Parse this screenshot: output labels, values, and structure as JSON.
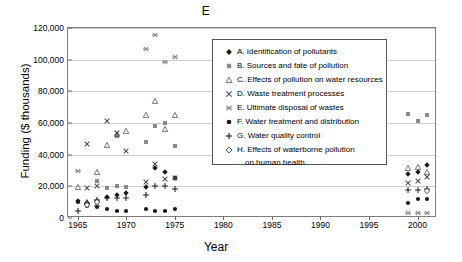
{
  "chart_data": {
    "type": "scatter",
    "title": "E",
    "xlabel": "Year",
    "ylabel": "Funding ($ thousands)",
    "xlim": [
      1964,
      2002
    ],
    "ylim": [
      0,
      120000
    ],
    "xticks": [
      1965,
      1970,
      1975,
      1980,
      1985,
      1990,
      1995,
      2000
    ],
    "yticks": [
      0,
      20000,
      40000,
      60000,
      80000,
      100000,
      120000
    ],
    "ytick_labels": [
      "0",
      "20,000",
      "40,000",
      "60,000",
      "80,000",
      "100,000",
      "120,000"
    ],
    "xtick_labels": [
      "1965",
      "1970",
      "1975",
      "1980",
      "1985",
      "1990",
      "1995",
      "2000"
    ],
    "grid": "horizontal",
    "legend_position": "upper-right-inside",
    "series": [
      {
        "key": "A",
        "name": "A. Identification of pollutants",
        "marker": "filled-diamond",
        "color": "#1a1a1a",
        "points": [
          {
            "x": 1965,
            "y": 10500
          },
          {
            "x": 1966,
            "y": 8800
          },
          {
            "x": 1967,
            "y": 11000
          },
          {
            "x": 1968,
            "y": 13200
          },
          {
            "x": 1969,
            "y": 14600
          },
          {
            "x": 1970,
            "y": 16000
          },
          {
            "x": 1972,
            "y": 19800
          },
          {
            "x": 1973,
            "y": 31500
          },
          {
            "x": 1974,
            "y": 28800
          },
          {
            "x": 1975,
            "y": 25000
          },
          {
            "x": 1999,
            "y": 27500
          },
          {
            "x": 2000,
            "y": 29300
          },
          {
            "x": 2001,
            "y": 33200
          }
        ]
      },
      {
        "key": "B",
        "name": "B. Sources and fate of pollution",
        "marker": "filled-square",
        "color": "#8a8a8a",
        "points": [
          {
            "x": 1966,
            "y": 9200
          },
          {
            "x": 1967,
            "y": 23500
          },
          {
            "x": 1968,
            "y": 19200
          },
          {
            "x": 1969,
            "y": 20000
          },
          {
            "x": 1970,
            "y": 19300
          },
          {
            "x": 1972,
            "y": 47800
          },
          {
            "x": 1973,
            "y": 58200
          },
          {
            "x": 1974,
            "y": 60200
          },
          {
            "x": 1975,
            "y": 45300
          },
          {
            "x": 1969,
            "y": 52000
          },
          {
            "x": 1999,
            "y": 65800
          },
          {
            "x": 2000,
            "y": 61500
          },
          {
            "x": 2001,
            "y": 65300
          }
        ]
      },
      {
        "key": "C",
        "name": "C. Effects of pollution on water resources",
        "marker": "open-triangle",
        "color": "#4d4d4d",
        "points": [
          {
            "x": 1965,
            "y": 19800
          },
          {
            "x": 1966,
            "y": 9800
          },
          {
            "x": 1967,
            "y": 28800
          },
          {
            "x": 1967,
            "y": 9000
          },
          {
            "x": 1968,
            "y": 46000
          },
          {
            "x": 1969,
            "y": 52800
          },
          {
            "x": 1970,
            "y": 55000
          },
          {
            "x": 1972,
            "y": 64800
          },
          {
            "x": 1973,
            "y": 73800
          },
          {
            "x": 1974,
            "y": 56000
          },
          {
            "x": 1975,
            "y": 64800
          },
          {
            "x": 1999,
            "y": 31800
          },
          {
            "x": 2000,
            "y": 32500
          },
          {
            "x": 2001,
            "y": 29000
          }
        ]
      },
      {
        "key": "D",
        "name": "D. Waste treatment processes",
        "marker": "x-cross",
        "color": "#4d4d4d",
        "points": [
          {
            "x": 1966,
            "y": 18800
          },
          {
            "x": 1966,
            "y": 46500
          },
          {
            "x": 1967,
            "y": 20000
          },
          {
            "x": 1968,
            "y": 61500
          },
          {
            "x": 1969,
            "y": 53500
          },
          {
            "x": 1970,
            "y": 42500
          },
          {
            "x": 1972,
            "y": 22800
          },
          {
            "x": 1973,
            "y": 33800
          },
          {
            "x": 1974,
            "y": 24800
          },
          {
            "x": 1975,
            "y": 25000
          },
          {
            "x": 1999,
            "y": 22000
          },
          {
            "x": 2000,
            "y": 23500
          },
          {
            "x": 2001,
            "y": 26000
          }
        ]
      },
      {
        "key": "E",
        "name": "E. Ultimate disposal of wastes",
        "marker": "star-cross",
        "color": "#8a8a8a",
        "points": [
          {
            "x": 1965,
            "y": 29500
          },
          {
            "x": 1972,
            "y": 107000
          },
          {
            "x": 1973,
            "y": 115500
          },
          {
            "x": 1974,
            "y": 98800
          },
          {
            "x": 1975,
            "y": 101800
          },
          {
            "x": 1999,
            "y": 3200
          },
          {
            "x": 2000,
            "y": 3200
          },
          {
            "x": 2001,
            "y": 3200
          }
        ]
      },
      {
        "key": "F",
        "name": "F. Water treatment and distribution",
        "marker": "filled-circle",
        "color": "#1a1a1a",
        "points": [
          {
            "x": 1965,
            "y": 10200
          },
          {
            "x": 1966,
            "y": 7800
          },
          {
            "x": 1967,
            "y": 6800
          },
          {
            "x": 1968,
            "y": 5500
          },
          {
            "x": 1969,
            "y": 4500
          },
          {
            "x": 1970,
            "y": 4500
          },
          {
            "x": 1972,
            "y": 5500
          },
          {
            "x": 1973,
            "y": 4200
          },
          {
            "x": 1974,
            "y": 4500
          },
          {
            "x": 1975,
            "y": 6000
          },
          {
            "x": 1999,
            "y": 9500
          },
          {
            "x": 2000,
            "y": 12200
          },
          {
            "x": 2001,
            "y": 11800
          }
        ]
      },
      {
        "key": "G",
        "name": "G. Water quality control",
        "marker": "plus",
        "color": "#1a1a1a",
        "points": [
          {
            "x": 1965,
            "y": 4200
          },
          {
            "x": 1966,
            "y": 9500
          },
          {
            "x": 1967,
            "y": 11500
          },
          {
            "x": 1968,
            "y": 12500
          },
          {
            "x": 1969,
            "y": 12800
          },
          {
            "x": 1970,
            "y": 12500
          },
          {
            "x": 1972,
            "y": 14500
          },
          {
            "x": 1973,
            "y": 20200
          },
          {
            "x": 1974,
            "y": 20000
          },
          {
            "x": 1975,
            "y": 18500
          },
          {
            "x": 1999,
            "y": 17500
          },
          {
            "x": 2000,
            "y": 17500
          },
          {
            "x": 2001,
            "y": 18200
          }
        ]
      },
      {
        "key": "H",
        "name": "H. Effects of waterborne pollution",
        "name_line2": "on human health",
        "marker": "open-diamond",
        "color": "#1a1a1a",
        "points": [
          {
            "x": 1966,
            "y": 8200
          },
          {
            "x": 1967,
            "y": 9800
          },
          {
            "x": 2001,
            "y": 17000
          }
        ]
      }
    ]
  },
  "legend": {
    "items": [
      {
        "label": "A. Identification of pollutants",
        "marker": "filled-diamond"
      },
      {
        "label": "B. Sources and fate of pollution",
        "marker": "filled-square"
      },
      {
        "label": "C. Effects of pollution on water resources",
        "marker": "open-triangle"
      },
      {
        "label": "D. Waste treatment processes",
        "marker": "x-cross"
      },
      {
        "label": "E. Ultimate disposal of wastes",
        "marker": "star-cross"
      },
      {
        "label": "F. Water treatment and distribution",
        "marker": "filled-circle"
      },
      {
        "label": "G. Water quality control",
        "marker": "plus"
      },
      {
        "label": "H. Effects of waterborne pollution",
        "marker": "open-diamond",
        "label2": "on human health"
      }
    ]
  }
}
